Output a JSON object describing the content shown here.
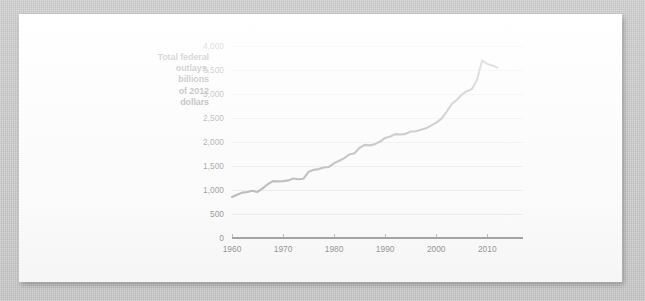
{
  "figure": {
    "background_color": "#c9c9c9",
    "paper_color": "#fdfdfd",
    "axis_label": {
      "line1": "Total federal",
      "line2": "outlays,",
      "line3": "billions",
      "line4": "of 2012",
      "line5": "dollars"
    }
  },
  "chart_data": {
    "type": "line",
    "title": "",
    "subtitle": "",
    "xlabel": "",
    "ylabel": "Total federal outlays, billions of 2012 dollars",
    "xlim": [
      1960,
      2017
    ],
    "ylim": [
      0,
      4000
    ],
    "grid": true,
    "legend": false,
    "legend_position": "none",
    "line_color": "#6e6e6e",
    "ytick_labels": [
      "0",
      "500",
      "1,000",
      "1,500",
      "2,000",
      "2,500",
      "3,000",
      "3,500",
      "4,000"
    ],
    "ytick_values": [
      0,
      500,
      1000,
      1500,
      2000,
      2500,
      3000,
      3500,
      4000
    ],
    "xtick_labels": [
      "1960",
      "1970",
      "1980",
      "1990",
      "2000",
      "2010"
    ],
    "xtick_values": [
      1960,
      1970,
      1980,
      1990,
      2000,
      2010
    ],
    "series": [
      {
        "name": "Total federal outlays",
        "x": [
          1960,
          1961,
          1962,
          1963,
          1964,
          1965,
          1966,
          1967,
          1968,
          1969,
          1970,
          1971,
          1972,
          1973,
          1974,
          1975,
          1976,
          1977,
          1978,
          1979,
          1980,
          1981,
          1982,
          1983,
          1984,
          1985,
          1986,
          1987,
          1988,
          1989,
          1990,
          1991,
          1992,
          1993,
          1994,
          1995,
          1996,
          1997,
          1998,
          1999,
          2000,
          2001,
          2002,
          2003,
          2004,
          2005,
          2006,
          2007,
          2008,
          2009,
          2010,
          2011,
          2012
        ],
        "values": [
          855,
          900,
          945,
          960,
          985,
          960,
          1035,
          1120,
          1185,
          1180,
          1185,
          1200,
          1240,
          1225,
          1235,
          1380,
          1420,
          1435,
          1470,
          1480,
          1560,
          1610,
          1665,
          1740,
          1765,
          1880,
          1940,
          1930,
          1955,
          2010,
          2085,
          2115,
          2165,
          2155,
          2170,
          2220,
          2225,
          2255,
          2285,
          2340,
          2405,
          2480,
          2625,
          2785,
          2875,
          2985,
          3060,
          3105,
          3295,
          3700,
          3625,
          3595,
          3550
        ]
      }
    ]
  }
}
